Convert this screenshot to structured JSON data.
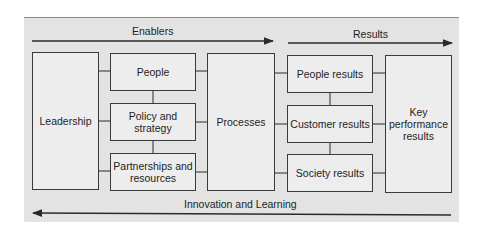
{
  "diagram": {
    "type": "EFQM excellence model",
    "top_labels": {
      "enablers": "Enablers",
      "results": "Results"
    },
    "bottom_label": "Innovation and Learning",
    "boxes": {
      "leadership": "Leadership",
      "people": "People",
      "policy": "Policy and strategy",
      "partnerships": "Partnerships and resources",
      "processes": "Processes",
      "people_results": "People results",
      "customer_results": "Customer results",
      "society_results": "Society results",
      "kpr": "Key performance results"
    },
    "colors": {
      "panel": "#e3e3e3",
      "box": "#ededed",
      "line": "#2a2a2a"
    }
  }
}
